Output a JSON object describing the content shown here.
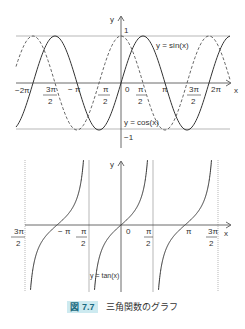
{
  "chart_data": [
    {
      "type": "line",
      "title": "",
      "xlabel": "x",
      "ylabel": "y",
      "xlim": [
        -6.6,
        6.9
      ],
      "ylim": [
        -1.6,
        1.5
      ],
      "grid": false,
      "x_tick_labels": [
        "-2π",
        "-3π/2",
        "-π",
        "-π/2",
        "0",
        "π/2",
        "π",
        "3π/2",
        "2π"
      ],
      "y_tick_labels": [
        "1",
        "-1"
      ],
      "reference_lines": [
        "y = 1",
        "y = -1"
      ],
      "series": [
        {
          "name": "y = sin(x)",
          "style": "solid",
          "function": "sin(x)",
          "x": [
            -6.28,
            -4.71,
            -3.14,
            -1.57,
            0,
            1.57,
            3.14,
            4.71,
            6.28
          ],
          "values": [
            0,
            1,
            0,
            -1,
            0,
            1,
            0,
            -1,
            0
          ]
        },
        {
          "name": "y = cos(x)",
          "style": "dashed",
          "function": "cos(x)",
          "x": [
            -6.28,
            -4.71,
            -3.14,
            -1.57,
            0,
            1.57,
            3.14,
            4.71,
            6.28
          ],
          "values": [
            1,
            0,
            -1,
            0,
            1,
            0,
            -1,
            0,
            1
          ]
        }
      ]
    },
    {
      "type": "line",
      "title": "",
      "xlabel": "x",
      "ylabel": "y",
      "xlim": [
        -4.8,
        5.1
      ],
      "grid": false,
      "x_tick_labels": [
        "-3π/2",
        "-π",
        "-π/2",
        "0",
        "π/2",
        "π",
        "3π/2"
      ],
      "asymptotes": [
        "x = -3π/2",
        "x = -π/2",
        "x = π/2",
        "x = 3π/2"
      ],
      "series": [
        {
          "name": "y = tan(x)",
          "style": "solid",
          "function": "tan(x)",
          "x": [
            -3.14,
            0,
            3.14
          ],
          "values": [
            0,
            0,
            0
          ]
        }
      ]
    }
  ],
  "top": {
    "axis_x": "x",
    "axis_y": "y",
    "y_one": "1",
    "y_neg_one": "−1",
    "sin_label": "y = sin(x)",
    "cos_label": "y = cos(x)",
    "ticks": {
      "m2pi": "−2π",
      "m3pi_num": "3π",
      "mpi": "− π",
      "mpi2_num": "π",
      "zero": "0",
      "pi2_num": "π",
      "pi": "π",
      "p3pi_num": "3π",
      "p2pi": "2π",
      "den": "2"
    }
  },
  "bottom": {
    "axis_x": "x",
    "axis_y": "y",
    "tan_label": "y = tan(x)",
    "ticks": {
      "m3pi_num": "3π",
      "mpi": "− π",
      "mpi2_num": "π",
      "zero": "0",
      "pi2_num": "π",
      "pi": "π",
      "p3pi_num": "3π",
      "den": "2"
    }
  },
  "caption": {
    "badge": "図 7.7",
    "text": "三角関数のグラフ"
  }
}
